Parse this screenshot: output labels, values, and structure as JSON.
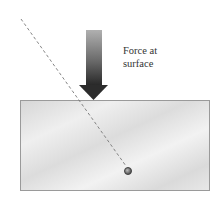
{
  "diagram": {
    "type": "physics-force-diagram",
    "label": {
      "line1": "Force at",
      "line2": "surface"
    },
    "elements": {
      "block": {
        "x": 20,
        "y": 100,
        "width": 190,
        "height": 91,
        "fill": "#e4e4e4",
        "stroke": "#9a9a9a"
      },
      "force_arrow": {
        "direction": "down",
        "tip": [
          93,
          100
        ],
        "color_top": "#a8a8a8",
        "color_bottom": "#2a2a2a"
      },
      "line_of_action": {
        "from": [
          21,
          19
        ],
        "to": [
          127,
          168
        ],
        "style": "dashed",
        "color": "#777777"
      },
      "point": {
        "cx": 128,
        "cy": 171,
        "r": 3.5,
        "color": "#555555"
      }
    }
  }
}
